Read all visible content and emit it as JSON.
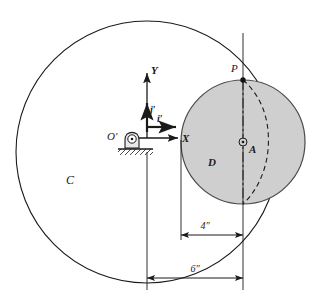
{
  "figure": {
    "kind": "mechanics-kinematics-diagram",
    "background_color": "#ffffff",
    "line_color": "#1a1a1a",
    "disk_fill_color": "#cfcfcf",
    "disk_stroke_color": "#4a4a4a"
  },
  "labels": {
    "big_circle": "C",
    "disk": "D",
    "contact_point": "P",
    "disk_center": "A",
    "origin": "O′",
    "x_axis": "X",
    "y_axis": "Y",
    "unit_i": "i′",
    "unit_j": "j′"
  },
  "dimensions": [
    {
      "name": "inner-radius-dim",
      "value": "4″",
      "from_label": "left-tick",
      "to_label": "center-line"
    },
    {
      "name": "outer-radius-dim",
      "value": "6″",
      "from_label": "origin-line",
      "to_label": "center-line"
    }
  ],
  "geometry": {
    "circle_c": {
      "cx": 147,
      "cy": 152,
      "r": 131
    },
    "disk_d": {
      "cx": 243,
      "cy": 142,
      "r": 62
    },
    "point_p": {
      "x": 243,
      "y": 80
    },
    "origin_o": {
      "x": 128,
      "y": 138
    }
  }
}
